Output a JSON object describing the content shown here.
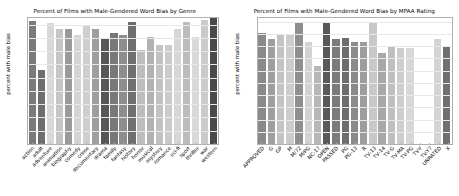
{
  "figure": {
    "background": "#ffffff",
    "bar_color_palette": [
      "#7a7a7a",
      "#6e6e6e",
      "#c9c9c9",
      "#b5b5b5",
      "#8a8a8a",
      "#d2d2d2",
      "#c0c0c0",
      "#9b9b9b",
      "#5a5a5a",
      "#707070",
      "#7f7f7f",
      "#6b6b6b",
      "#a5a5a5",
      "#c6c6c6",
      "#bdbdbd",
      "#d0d0d0",
      "#b8b8b8",
      "#9e9e9e",
      "#cfcfcf",
      "#8f8f8f",
      "#626262",
      "#4f4f4f"
    ]
  },
  "chart_data": [
    {
      "type": "bar",
      "title": "Percent of Films with Male-Gendered Word Bias by Genre",
      "xlabel": "",
      "ylabel": "percent with male bias",
      "ylim": [
        0,
        95
      ],
      "yticks": [
        0,
        10,
        20,
        30,
        40,
        50,
        60,
        70,
        80,
        90
      ],
      "grid": true,
      "legend": "none",
      "categories": [
        "action",
        "adult",
        "adventure",
        "animation",
        "biography",
        "comedy",
        "crime",
        "documentary",
        "drama",
        "family",
        "fantasy",
        "history",
        "horror",
        "musical",
        "mystery",
        "romance",
        "sci-fi",
        "sport",
        "thriller",
        "war",
        "western"
      ],
      "values": [
        93,
        56,
        91,
        87,
        87,
        82,
        89,
        87,
        79,
        83.5,
        82,
        92,
        71,
        81,
        74.5,
        75,
        87,
        92,
        81,
        93.5,
        97
      ],
      "bar_colors": [
        "#7a7a7a",
        "#6e6e6e",
        "#d8d8d8",
        "#c5c5c5",
        "#9a9a9a",
        "#d4d4d4",
        "#cfcfcf",
        "#9e9e9e",
        "#575757",
        "#787878",
        "#8d8d8d",
        "#6f6f6f",
        "#bdbdbd",
        "#b2b2b2",
        "#c2c2c2",
        "#cacaca",
        "#d6d6d6",
        "#bcbcbc",
        "#d9d9d9",
        "#cbcbcb",
        "#4a4a4a"
      ]
    },
    {
      "type": "bar",
      "title": "Percent of Films with Male-Gendered Word Bias by MPAA Rating",
      "xlabel": "",
      "ylabel": "percent with male bias",
      "ylim": [
        0,
        103
      ],
      "yticks": [
        0,
        10,
        20,
        30,
        40,
        50,
        60,
        70,
        80,
        90,
        100
      ],
      "grid": true,
      "legend": "none",
      "categories": [
        "APPROVED",
        "G",
        "GP",
        "M",
        "M/72",
        "M/PG",
        "NC-17",
        "OPEN",
        "PASSED",
        "PG",
        "PG-13",
        "R",
        "TV-13",
        "TV-14",
        "TV-G",
        "TV-MA",
        "TV-PG",
        "TV-Y",
        "TV-Y7",
        "UNRATED",
        "X"
      ],
      "values": [
        91,
        85.5,
        90,
        90,
        100,
        83.5,
        63.5,
        100,
        86,
        87,
        83.5,
        83.5,
        100,
        74.5,
        80.5,
        78.5,
        78.5,
        0,
        0,
        86,
        80.5
      ],
      "bar_colors": [
        "#8a8a8a",
        "#9f9f9f",
        "#c3c3c3",
        "#cccccc",
        "#8e8e8e",
        "#d2d2d2",
        "#b7b7b7",
        "#595959",
        "#7c7c7c",
        "#6d6d6d",
        "#8b8b8b",
        "#9d9d9d",
        "#c8c8c8",
        "#a8a8a8",
        "#bfbfbf",
        "#cdcdcd",
        "#d7d7d7",
        "#ffffff",
        "#ffffff",
        "#d4d4d4",
        "#707070"
      ]
    },
    {
      "type": "bar",
      "note": "extra right-most X bar",
      "categories": [
        "X"
      ],
      "values": [
        60
      ]
    }
  ]
}
